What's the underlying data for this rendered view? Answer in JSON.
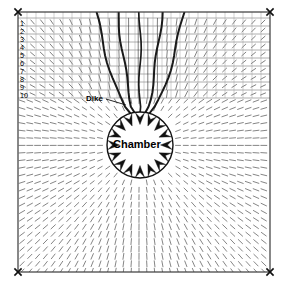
{
  "figure": {
    "type": "geomechanical-model-diagram",
    "background": "#ffffff",
    "line_color": "#1a1a1a",
    "field_color": "#555555",
    "grid_color": "#9a9a9a"
  },
  "frame": {
    "x": 18,
    "y": 12,
    "width": 252,
    "height": 260,
    "corner_marker_icon": "x-marker",
    "corner_markers": [
      {
        "name": "top-left",
        "x": 18,
        "y": 12
      },
      {
        "name": "top-right",
        "x": 270,
        "y": 12
      },
      {
        "name": "bottom-left",
        "x": 18,
        "y": 272
      },
      {
        "name": "bottom-right",
        "x": 270,
        "y": 272
      }
    ]
  },
  "layers": {
    "label_text": [
      "1",
      "2",
      "3",
      "4",
      "5",
      "6",
      "7",
      "8",
      "9",
      "10"
    ],
    "boundaries_y": [
      18,
      26,
      34,
      42,
      50,
      58,
      66,
      74,
      82,
      90,
      98
    ],
    "label_x": 20,
    "count": 10
  },
  "chamber": {
    "label": "Chamber",
    "center_x": 140,
    "center_y": 145,
    "radius": 33,
    "arrow_count": 16,
    "arrow_direction": "inward"
  },
  "dike": {
    "label": "Dike",
    "leader_from_x": 106,
    "leader_from_y": 99,
    "leader_to_x": 126,
    "leader_to_y": 105,
    "trace_count": 5,
    "description": "Funnel-shaped conduit flaring upward from chamber apex to the ground surface"
  },
  "field": {
    "type": "tensor-tick-field",
    "description": "Short line segments oriented radially/tangentially about the chamber"
  }
}
